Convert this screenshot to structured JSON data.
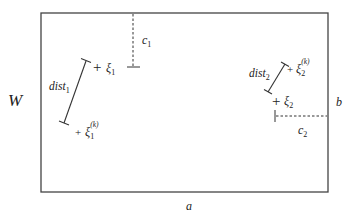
{
  "diagram": {
    "frame": {
      "x": 41,
      "y": 13,
      "width": 287,
      "height": 179,
      "stroke": "#444444"
    },
    "labels": {
      "left_side": "W",
      "right_side": "b",
      "bottom_side": "a",
      "c1": "c",
      "c1_sub": "1",
      "c2": "c",
      "c2_sub": "2",
      "dist1": "dist",
      "dist1_sub": "1",
      "dist2": "dist",
      "dist2_sub": "2",
      "xi1": "ξ",
      "xi1_sub": "1",
      "xi1k": "ξ",
      "xi1k_sub": "1",
      "xi1k_sup": "(k)",
      "xi2": "ξ",
      "xi2_sub": "2",
      "xi2k": "ξ",
      "xi2k_sub": "2",
      "xi2k_sup": "(k)",
      "plus": "+"
    },
    "points": {
      "xi1": {
        "x": 98,
        "y": 67
      },
      "xi1k": {
        "x": 78,
        "y": 132
      },
      "xi2": {
        "x": 278,
        "y": 100
      },
      "xi2k": {
        "x": 290,
        "y": 68
      }
    },
    "segments": {
      "dist1": {
        "x1": 86,
        "y1": 61,
        "x2": 64,
        "y2": 123
      },
      "dist2": {
        "x1": 285,
        "y1": 64,
        "x2": 268,
        "y2": 92
      },
      "c1": {
        "x": 133,
        "y1": 13,
        "y2": 67
      },
      "c2": {
        "y": 116,
        "x1": 275,
        "x2": 328
      }
    }
  }
}
